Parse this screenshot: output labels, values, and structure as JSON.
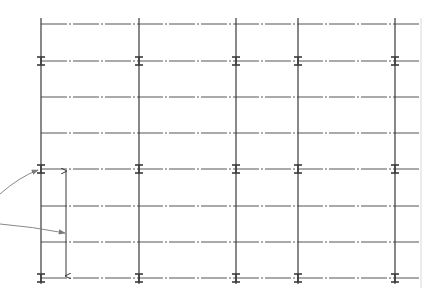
{
  "diagram": {
    "type": "structural-grid-plan",
    "colors": {
      "line": "#3a3a3a",
      "grid_line": "#555555",
      "leader": "#7a7a7a",
      "background": "#ffffff"
    },
    "columns_x": [
      41,
      139,
      236,
      298,
      395
    ],
    "floor_lines_y": [
      24,
      61,
      97,
      133,
      169,
      206,
      242,
      278
    ],
    "beam_marked_floors_y": [
      61,
      169,
      278
    ],
    "grid_right_edge_x": 420,
    "grid_left_edge_x": 41,
    "column_top_y": 18,
    "column_bottom_y": 284,
    "dimension": {
      "x": 66,
      "y_top": 169,
      "y_bottom": 278
    },
    "leaders": [
      {
        "name": "leader-to-beam",
        "from": [
          0,
          194
        ],
        "to": [
          38,
          170
        ]
      },
      {
        "name": "leader-to-dimension",
        "from": [
          0,
          224
        ],
        "to": [
          65,
          233
        ]
      }
    ]
  }
}
